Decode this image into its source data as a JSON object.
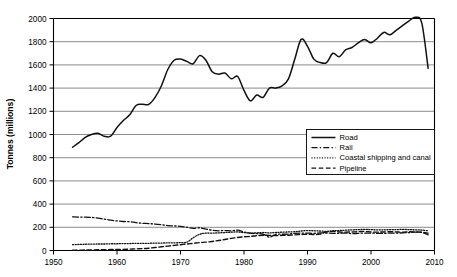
{
  "chart_data": {
    "type": "line",
    "title": "",
    "xlabel": "",
    "ylabel": "Tonnes (millions)",
    "xlim": [
      1950,
      2010
    ],
    "ylim": [
      0,
      2000
    ],
    "grid": true,
    "legend_position": "center-right",
    "xticks": [
      1950,
      1960,
      1970,
      1980,
      1990,
      2000,
      2010
    ],
    "yticks": [
      0,
      200,
      400,
      600,
      800,
      1000,
      1200,
      1400,
      1600,
      1800,
      2000
    ],
    "xtick_labels": [
      "1950",
      "1960",
      "1970",
      "1980",
      "1990",
      "2000",
      "2010"
    ],
    "ytick_labels": [
      "0",
      "200",
      "400",
      "600",
      "800",
      "1000",
      "1200",
      "1400",
      "1600",
      "1800",
      "2000"
    ],
    "x": [
      1953,
      1954,
      1955,
      1956,
      1957,
      1958,
      1959,
      1960,
      1961,
      1962,
      1963,
      1964,
      1965,
      1966,
      1967,
      1968,
      1969,
      1970,
      1971,
      1972,
      1973,
      1974,
      1975,
      1976,
      1977,
      1978,
      1979,
      1980,
      1981,
      1982,
      1983,
      1984,
      1985,
      1986,
      1987,
      1988,
      1989,
      1990,
      1991,
      1992,
      1993,
      1994,
      1995,
      1996,
      1997,
      1998,
      1999,
      2000,
      2001,
      2002,
      2003,
      2004,
      2005,
      2006,
      2007,
      2008,
      2009
    ],
    "series": [
      {
        "name": "Road",
        "style": "solid",
        "values": [
          890,
          930,
          975,
          1000,
          1010,
          985,
          985,
          1060,
          1120,
          1170,
          1250,
          1260,
          1260,
          1320,
          1420,
          1560,
          1640,
          1650,
          1630,
          1610,
          1680,
          1640,
          1540,
          1520,
          1530,
          1480,
          1500,
          1380,
          1290,
          1340,
          1320,
          1400,
          1400,
          1420,
          1480,
          1650,
          1820,
          1760,
          1650,
          1620,
          1620,
          1700,
          1670,
          1730,
          1750,
          1790,
          1820,
          1790,
          1830,
          1880,
          1860,
          1900,
          1940,
          1980,
          2010,
          1960,
          1570
        ]
      },
      {
        "name": "Rail",
        "style": "dashdot",
        "values": [
          290,
          288,
          288,
          285,
          280,
          270,
          262,
          255,
          250,
          248,
          240,
          235,
          232,
          228,
          222,
          215,
          212,
          208,
          200,
          190,
          196,
          185,
          175,
          170,
          172,
          170,
          175,
          160,
          150,
          145,
          142,
          115,
          140,
          140,
          142,
          148,
          150,
          150,
          148,
          152,
          150,
          148,
          148,
          150,
          145,
          148,
          150,
          150,
          148,
          148,
          150,
          150,
          152,
          155,
          158,
          155,
          135
        ]
      },
      {
        "name": "Coastal shipping and canal",
        "style": "dotted",
        "values": [
          50,
          52,
          54,
          55,
          56,
          56,
          58,
          58,
          60,
          60,
          62,
          62,
          62,
          64,
          64,
          66,
          66,
          68,
          72,
          110,
          140,
          150,
          150,
          152,
          155,
          158,
          160,
          155,
          150,
          152,
          155,
          152,
          155,
          158,
          160,
          162,
          168,
          172,
          170,
          168,
          165,
          170,
          172,
          175,
          178,
          180,
          182,
          180,
          178,
          178,
          180,
          180,
          182,
          180,
          178,
          176,
          170
        ]
      },
      {
        "name": "Pipeline",
        "style": "dashed",
        "values": [
          2,
          3,
          4,
          5,
          6,
          7,
          8,
          9,
          10,
          12,
          14,
          16,
          20,
          26,
          32,
          38,
          44,
          50,
          56,
          62,
          68,
          72,
          78,
          86,
          95,
          105,
          112,
          118,
          122,
          128,
          132,
          130,
          128,
          130,
          132,
          135,
          138,
          140,
          138,
          142,
          160,
          165,
          160,
          158,
          160,
          162,
          165,
          160,
          158,
          160,
          162,
          160,
          158,
          162,
          160,
          158,
          150
        ]
      }
    ]
  },
  "legend": {
    "items": [
      {
        "label": "Road",
        "style": "solid"
      },
      {
        "label": "Rail",
        "style": "dashdot"
      },
      {
        "label": "Coastal shipping and canal",
        "style": "dotted"
      },
      {
        "label": "Pipeline",
        "style": "dashed"
      }
    ]
  }
}
